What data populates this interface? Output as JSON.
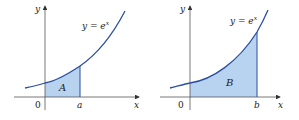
{
  "figures": [
    {
      "id": "left",
      "equation": "y = e",
      "exponent": "x",
      "region_label": "A",
      "origin_label": "0",
      "bound_label": "a",
      "x_axis_label": "x",
      "y_axis_label": "y"
    },
    {
      "id": "right",
      "equation": "y = e",
      "exponent": "x",
      "region_label": "B",
      "origin_label": "0",
      "bound_label": "b",
      "x_axis_label": "x",
      "y_axis_label": "y"
    }
  ],
  "colors": {
    "curve": "#2b4fa0",
    "fill": "#b8d3f0",
    "axis": "#555555"
  }
}
